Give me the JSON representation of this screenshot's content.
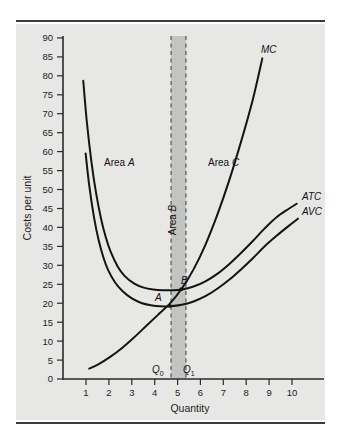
{
  "figure": {
    "background": "#ffffff",
    "plot_background": "#e7e7e5",
    "rule_color": "#3b3b3b",
    "curve_color": "#141414",
    "band_color": "#c3c3c1"
  },
  "chart_data": {
    "type": "line",
    "title": "",
    "xlabel": "Quantity",
    "ylabel": "Costs per unit",
    "xlim": [
      0,
      11
    ],
    "ylim": [
      0,
      92
    ],
    "grid": false,
    "legend": "inline-curve-labels",
    "x_ticks": [
      1,
      2,
      3,
      4,
      5,
      6,
      7,
      8,
      9,
      10
    ],
    "x_tick_labels": [
      "1",
      "2",
      "3",
      "4",
      "5",
      "6",
      "7",
      "8",
      "9",
      "10"
    ],
    "y_ticks": [
      0,
      5,
      10,
      15,
      20,
      25,
      30,
      35,
      40,
      45,
      50,
      55,
      60,
      65,
      70,
      75,
      80,
      85,
      90
    ],
    "y_tick_labels": [
      "0",
      "5",
      "10",
      "15",
      "20",
      "25",
      "30",
      "35",
      "40",
      "45",
      "50",
      "55",
      "60",
      "65",
      "70",
      "75",
      "80",
      "85",
      "90"
    ],
    "series": [
      {
        "name": "ATC",
        "label": "ATC",
        "label_position": "right-end",
        "points": [
          [
            0.85,
            80.0
          ],
          [
            1.0,
            69.0
          ],
          [
            1.2,
            58.0
          ],
          [
            1.4,
            49.5
          ],
          [
            1.6,
            43.0
          ],
          [
            1.8,
            38.0
          ],
          [
            2.0,
            34.2
          ],
          [
            2.3,
            30.2
          ],
          [
            2.6,
            27.6
          ],
          [
            3.0,
            25.6
          ],
          [
            3.4,
            24.5
          ],
          [
            3.8,
            24.0
          ],
          [
            4.2,
            23.8
          ],
          [
            4.6,
            23.8
          ],
          [
            5.0,
            24.0
          ],
          [
            5.5,
            24.8
          ],
          [
            6.0,
            26.2
          ],
          [
            6.5,
            28.2
          ],
          [
            7.0,
            30.8
          ],
          [
            7.5,
            33.8
          ],
          [
            8.0,
            37.0
          ],
          [
            8.5,
            40.4
          ],
          [
            9.0,
            43.4
          ],
          [
            9.5,
            45.6
          ],
          [
            9.85,
            47.0
          ]
        ]
      },
      {
        "name": "AVC",
        "label": "AVC",
        "label_position": "right-end",
        "points": [
          [
            0.95,
            60.5
          ],
          [
            1.1,
            52.0
          ],
          [
            1.3,
            43.5
          ],
          [
            1.5,
            37.2
          ],
          [
            1.7,
            32.6
          ],
          [
            1.9,
            29.2
          ],
          [
            2.2,
            25.8
          ],
          [
            2.5,
            23.6
          ],
          [
            2.9,
            21.6
          ],
          [
            3.3,
            20.4
          ],
          [
            3.7,
            19.8
          ],
          [
            4.1,
            19.5
          ],
          [
            4.5,
            19.5
          ],
          [
            5.0,
            19.9
          ],
          [
            5.5,
            20.8
          ],
          [
            6.0,
            22.2
          ],
          [
            6.5,
            24.2
          ],
          [
            7.0,
            26.6
          ],
          [
            7.5,
            29.4
          ],
          [
            8.0,
            32.4
          ],
          [
            8.5,
            35.6
          ],
          [
            9.0,
            38.4
          ],
          [
            9.5,
            41.0
          ],
          [
            9.9,
            43.0
          ]
        ]
      },
      {
        "name": "MC",
        "label": "MC",
        "label_position": "top-right",
        "points": [
          [
            1.1,
            2.8
          ],
          [
            1.5,
            4.0
          ],
          [
            2.0,
            6.0
          ],
          [
            2.5,
            8.4
          ],
          [
            3.0,
            11.2
          ],
          [
            3.5,
            14.2
          ],
          [
            4.0,
            17.2
          ],
          [
            4.5,
            20.2
          ],
          [
            5.0,
            24.2
          ],
          [
            5.5,
            29.4
          ],
          [
            6.0,
            36.0
          ],
          [
            6.5,
            44.0
          ],
          [
            7.0,
            53.2
          ],
          [
            7.5,
            63.6
          ],
          [
            8.0,
            75.0
          ],
          [
            8.4,
            86.0
          ]
        ]
      }
    ],
    "annotations": [
      {
        "name": "area-a",
        "text": "Area A",
        "emphasis": "A",
        "x": 2.7,
        "y": 56.0
      },
      {
        "name": "area-b",
        "text": "Area B",
        "emphasis": "B",
        "x": 4.72,
        "y": 42.0,
        "rotated": true
      },
      {
        "name": "area-c",
        "text": "Area C",
        "emphasis": "C",
        "x": 6.6,
        "y": 56.0
      },
      {
        "name": "point-a",
        "text": "A",
        "x": 4.35,
        "y": 21.8
      },
      {
        "name": "point-b",
        "text": "B",
        "x": 5.15,
        "y": 25.8
      },
      {
        "name": "q0",
        "text": "Q",
        "subscript": "0",
        "x": 4.13,
        "y": 3.6
      },
      {
        "name": "q1",
        "text": "Q",
        "subscript": "1",
        "x": 5.0,
        "y": 3.6
      }
    ],
    "markers": [
      {
        "name": "point-a-marker",
        "x": 4.5,
        "y": 19.6
      },
      {
        "name": "point-b-marker",
        "x": 4.98,
        "y": 24.1
      }
    ],
    "vertical_lines": [
      {
        "name": "q0-dashed-line",
        "x": 4.55,
        "style": "dashed"
      },
      {
        "name": "q1-dashed-line",
        "x": 5.18,
        "style": "dashed"
      }
    ],
    "shaded_band": {
      "name": "area-b-band",
      "x_start": 4.55,
      "x_end": 5.18,
      "color": "#c3c3c1"
    }
  }
}
